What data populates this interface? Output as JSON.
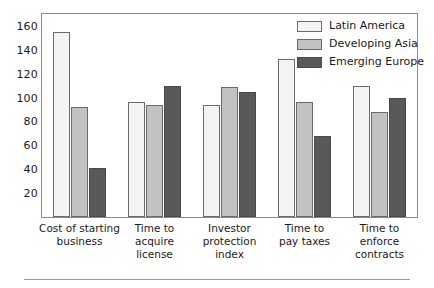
{
  "chart_data": {
    "type": "bar",
    "title": "",
    "subtitle": "",
    "xlabel": "",
    "ylabel": "",
    "grid": false,
    "legend_position": "top-right",
    "ylim": [
      0,
      170
    ],
    "yticks": [
      20,
      40,
      60,
      80,
      100,
      120,
      140,
      160
    ],
    "ytick_labels": [
      "20",
      "40",
      "60",
      "80",
      "100",
      "120",
      "140",
      "160"
    ],
    "categories": [
      "Cost of starting business",
      "Time to acquire license",
      "Investor protection index",
      "Time to pay taxes",
      "Time to enforce contracts"
    ],
    "category_lines": [
      [
        "Cost of starting",
        "business"
      ],
      [
        "Time to",
        "acquire",
        "license"
      ],
      [
        "Investor",
        "protection",
        "index"
      ],
      [
        "Time to",
        "pay taxes"
      ],
      [
        "Time to",
        "enforce",
        "contracts"
      ]
    ],
    "series": [
      {
        "name": "Latin America",
        "color": "#f4f4f2",
        "values": [
          155,
          96,
          94,
          132,
          110
        ]
      },
      {
        "name": "Developing Asia",
        "color": "#c2c2c0",
        "values": [
          92,
          94,
          109,
          96,
          88
        ]
      },
      {
        "name": "Emerging Europe",
        "color": "#59595a",
        "values": [
          41,
          110,
          105,
          68,
          100
        ]
      }
    ]
  },
  "legend": {
    "items": [
      {
        "label": "Latin America",
        "swatch": "legend-swatch-latin-america"
      },
      {
        "label": "Developing Asia",
        "swatch": "legend-swatch-developing-asia"
      },
      {
        "label": "Emerging Europe",
        "swatch": "legend-swatch-emerging-europe"
      }
    ]
  },
  "axes": {
    "y_tick_labels": [
      "160",
      "140",
      "120",
      "100",
      "80",
      "60",
      "40",
      "20"
    ]
  }
}
